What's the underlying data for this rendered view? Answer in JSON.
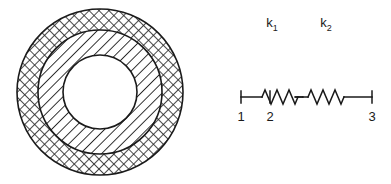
{
  "figure": {
    "title": "",
    "panels": [
      {
        "name": "concentric-annulus",
        "description": "Concentric circular cross-section with three regions",
        "regions": [
          {
            "label": "outer-ring",
            "hatch": "cross-hatch",
            "outer_radius": 83,
            "inner_radius": 62
          },
          {
            "label": "inner-ring",
            "hatch": "diagonal-hatch",
            "outer_radius": 62,
            "inner_radius": 37
          },
          {
            "label": "core",
            "hatch": "none",
            "outer_radius": 37,
            "inner_radius": 0
          }
        ],
        "center": {
          "x": 100,
          "y": 92
        },
        "stroke_color": "#1a1a1a"
      },
      {
        "name": "spring-system",
        "description": "Two springs in series connecting three nodes",
        "nodes": [
          {
            "id": "1",
            "label": "1",
            "x": 41
          },
          {
            "id": "2",
            "label": "2",
            "x": 70
          },
          {
            "id": "3",
            "label": "3",
            "x": 172
          }
        ],
        "springs": [
          {
            "id": "k1",
            "label": "k",
            "subscript": "1",
            "from": "1",
            "to": "2"
          },
          {
            "id": "k2",
            "label": "k",
            "subscript": "2",
            "from": "2",
            "to": "3"
          }
        ],
        "axis_y": 97,
        "stroke_color": "#1a1a1a"
      }
    ]
  },
  "annulus": {
    "region_outer_label": "",
    "region_middle_label": "",
    "region_core_label": ""
  },
  "spring": {
    "k1_label": "k",
    "k1_sub": "1",
    "k2_label": "k",
    "k2_sub": "2",
    "node1_label": "1",
    "node2_label": "2",
    "node3_label": "3"
  },
  "colors": {
    "stroke": "#1a1a1a",
    "background": "#ffffff",
    "hatch": "#2a2a2a"
  }
}
